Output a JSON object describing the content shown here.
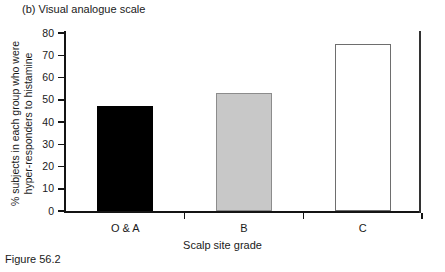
{
  "panel": {
    "label": "(b) Visual analogue scale"
  },
  "figure": {
    "caption": "Figure 56.2"
  },
  "chart_data": {
    "type": "bar",
    "title": "(b) Visual analogue scale",
    "categories": [
      "O & A",
      "B",
      "C"
    ],
    "values": [
      47,
      53,
      75
    ],
    "series": [
      {
        "name": "% hyper-responders to histamine",
        "values": [
          47,
          53,
          75
        ]
      }
    ],
    "bar_colors": [
      "#000000",
      "#c8c8c8",
      "#ffffff"
    ],
    "bar_edge_colors": [
      "#000000",
      "#8c8c8c",
      "#6e6e6e"
    ],
    "xlabel": "Scalp site grade",
    "ylabel": "% subjects in each group who were hyper-responders to histamine",
    "ylabel_line1": "% subjects in each group who were",
    "ylabel_line2": "hyper-responders to histamine",
    "ylim": [
      0,
      80
    ],
    "ytick_step": 10,
    "yticks": [
      0,
      10,
      20,
      30,
      40,
      50,
      60,
      70,
      80
    ],
    "ytick_labels": [
      "0",
      "10",
      "20",
      "30",
      "40",
      "50",
      "60",
      "70",
      "80"
    ],
    "grid": false,
    "legend": false,
    "legend_position": "none"
  }
}
